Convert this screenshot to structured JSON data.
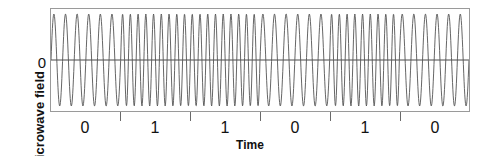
{
  "chart_data": {
    "type": "line",
    "title": "",
    "subtitle": "",
    "xlabel": "Time",
    "ylabel": "Microwave field",
    "y_tick_labels": [
      "0"
    ],
    "x_tick_labels": [
      "0",
      "1",
      "1",
      "0",
      "1",
      "0"
    ],
    "bit_sequence": [
      0,
      1,
      1,
      0,
      1,
      0
    ],
    "grid": false,
    "legend": "none",
    "zero_line": true,
    "annotation": "Frequency-shift-keyed microwave carrier: each labelled interval encodes one bit, low frequency for 0 and high frequency for 1.",
    "xlim": [
      0,
      6
    ],
    "ylim": [
      -1,
      1
    ],
    "amplitude": 1,
    "cycles_per_bit": {
      "0": 6,
      "1": 9
    },
    "segments": [
      {
        "bit": "0",
        "x_start": 0,
        "x_end": 1,
        "cycles": 6
      },
      {
        "bit": "1",
        "x_start": 1,
        "x_end": 2,
        "cycles": 9
      },
      {
        "bit": "1",
        "x_start": 2,
        "x_end": 3,
        "cycles": 9
      },
      {
        "bit": "0",
        "x_start": 3,
        "x_end": 4,
        "cycles": 6
      },
      {
        "bit": "1",
        "x_start": 4,
        "x_end": 5,
        "cycles": 9
      },
      {
        "bit": "0",
        "x_start": 5,
        "x_end": 6,
        "cycles": 6
      }
    ],
    "tick_positions": [
      1,
      2,
      3,
      4,
      5
    ],
    "colors": {
      "trace": "#555555",
      "frame": "#9a9a9a",
      "zero_line": "#4a4a4a",
      "tick": "#6a6a6a",
      "text": "#111111",
      "background": "#ffffff"
    }
  }
}
